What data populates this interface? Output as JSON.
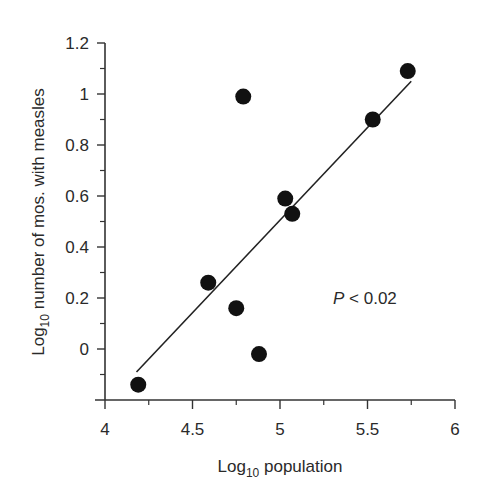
{
  "chart_data": {
    "type": "scatter",
    "title": "",
    "xlabel": "Log10 population",
    "xlabel_main": "Log",
    "xlabel_sub": "10",
    "xlabel_rest": " population",
    "ylabel": "Log10 number of mos. with measles",
    "ylabel_main": "Log",
    "ylabel_sub": "10",
    "ylabel_rest": " number of mos. with measles",
    "xlim": [
      4,
      6
    ],
    "ylim": [
      -0.2,
      1.2
    ],
    "x_ticks": [
      "4",
      "4.5",
      "5",
      "5.5",
      "6"
    ],
    "x_tick_values": [
      4,
      4.5,
      5,
      5.5,
      6
    ],
    "y_ticks": [
      "1.2",
      "1",
      "0.8",
      "0.6",
      "0.4",
      "0.2",
      "0"
    ],
    "y_tick_values": [
      1.2,
      1.0,
      0.8,
      0.6,
      0.4,
      0.2,
      0
    ],
    "grid": false,
    "legend": null,
    "points": [
      {
        "x": 4.19,
        "y": -0.14
      },
      {
        "x": 4.59,
        "y": 0.26
      },
      {
        "x": 4.75,
        "y": 0.16
      },
      {
        "x": 4.79,
        "y": 0.99
      },
      {
        "x": 4.88,
        "y": -0.02
      },
      {
        "x": 5.03,
        "y": 0.59
      },
      {
        "x": 5.07,
        "y": 0.53
      },
      {
        "x": 5.53,
        "y": 0.9
      },
      {
        "x": 5.73,
        "y": 1.09
      }
    ],
    "regression_line": {
      "x0": 4.18,
      "y0": -0.09,
      "x1": 5.75,
      "y1": 1.05
    },
    "annotations": [
      {
        "text_italic": "P",
        "text": " < 0.02",
        "x": 5.25,
        "y": 0.2
      }
    ]
  }
}
